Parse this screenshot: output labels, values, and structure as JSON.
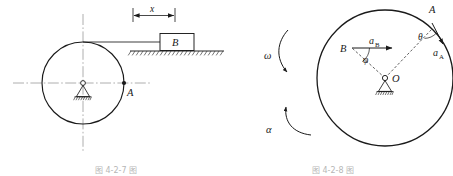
{
  "document": {
    "type": "engineering-mechanics-figure-pair",
    "background_color": "#ffffff",
    "line_color": "#1a1a1a",
    "centerline_color": "#9a9a9a",
    "caption_color": "#8a8a8a"
  },
  "figure_left": {
    "name": "flywheel-and-block-figure",
    "caption": "图 4-2-7 图",
    "labels": {
      "point_a": "A",
      "block_b": "B",
      "dimension_x": "x"
    },
    "elements": {
      "wheel": "circle with horizontal and vertical center lines",
      "support": "pin-support-at-center",
      "ground": "hatched-ground-line",
      "cord": "horizontal cord from wheel top to block B",
      "dimension": "displacement dimension x with double arrow"
    }
  },
  "figure_right": {
    "name": "rotating-disc-acceleration-figure",
    "caption": "图 4-2-8 图",
    "labels": {
      "point_a": "A",
      "point_b": "B",
      "center_o": "O",
      "accel_a": "a",
      "accel_a_sub": "A",
      "accel_b": "a",
      "accel_b_sub": "B",
      "angle_theta": "θ",
      "angle_phi": "φ",
      "omega": "ω",
      "alpha": "α"
    },
    "elements": {
      "disc": "large circle",
      "support": "pin-support-below-center",
      "radius_oa": "dashed radius from O to A",
      "radius_ob": "dashed radius from O to B",
      "vector_a_a": "acceleration vector at A",
      "vector_a_b": "horizontal acceleration vector at B",
      "omega_arrow": "curved angular velocity arrow",
      "alpha_arrow": "curved angular acceleration arrow"
    }
  }
}
